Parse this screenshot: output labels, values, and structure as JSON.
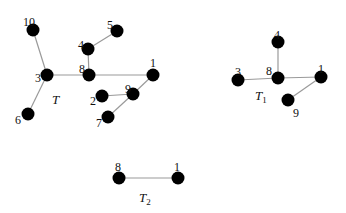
{
  "figure": {
    "graphs": [
      {
        "id": "T",
        "label": "T",
        "subscript": "",
        "label_pos": [
          52,
          104
        ],
        "nodes": [
          {
            "id": "10",
            "x": 33,
            "y": 30,
            "lx": 23,
            "ly": 22
          },
          {
            "id": "5",
            "x": 117,
            "y": 31,
            "lx": 107,
            "ly": 25
          },
          {
            "id": "4",
            "x": 88,
            "y": 49,
            "lx": 78,
            "ly": 45
          },
          {
            "id": "3",
            "x": 47,
            "y": 75,
            "lx": 35,
            "ly": 78
          },
          {
            "id": "8",
            "x": 89,
            "y": 75,
            "lx": 79,
            "ly": 69
          },
          {
            "id": "1",
            "x": 153,
            "y": 75,
            "lx": 150,
            "ly": 63
          },
          {
            "id": "2",
            "x": 102,
            "y": 96,
            "lx": 90,
            "ly": 101
          },
          {
            "id": "9",
            "x": 133,
            "y": 94,
            "lx": 125,
            "ly": 89
          },
          {
            "id": "6",
            "x": 28,
            "y": 114,
            "lx": 15,
            "ly": 120
          },
          {
            "id": "7",
            "x": 108,
            "y": 117,
            "lx": 96,
            "ly": 123
          }
        ],
        "edges": [
          [
            "10",
            "3"
          ],
          [
            "3",
            "8"
          ],
          [
            "8",
            "1"
          ],
          [
            "3",
            "6"
          ],
          [
            "8",
            "4"
          ],
          [
            "4",
            "5"
          ],
          [
            "1",
            "9"
          ],
          [
            "9",
            "2"
          ],
          [
            "9",
            "7"
          ]
        ]
      },
      {
        "id": "T1",
        "label": "T",
        "subscript": "1",
        "label_pos": [
          255,
          100
        ],
        "nodes": [
          {
            "id": "4",
            "x": 278,
            "y": 42,
            "lx": 274,
            "ly": 35
          },
          {
            "id": "3",
            "x": 238,
            "y": 80,
            "lx": 235,
            "ly": 72
          },
          {
            "id": "8",
            "x": 278,
            "y": 78,
            "lx": 266,
            "ly": 71
          },
          {
            "id": "1",
            "x": 321,
            "y": 77,
            "lx": 318,
            "ly": 69
          },
          {
            "id": "9",
            "x": 288,
            "y": 100,
            "lx": 293,
            "ly": 113
          }
        ],
        "edges": [
          [
            "3",
            "8"
          ],
          [
            "8",
            "4"
          ],
          [
            "8",
            "1"
          ],
          [
            "1",
            "9"
          ]
        ]
      },
      {
        "id": "T2",
        "label": "T",
        "subscript": "2",
        "label_pos": [
          139,
          202
        ],
        "nodes": [
          {
            "id": "8",
            "x": 119,
            "y": 178,
            "lx": 115,
            "ly": 167
          },
          {
            "id": "1",
            "x": 178,
            "y": 178,
            "lx": 174,
            "ly": 167
          }
        ],
        "edges": [
          [
            "8",
            "1"
          ]
        ]
      }
    ],
    "colors": {
      "node": "#000000",
      "edge": "#9a9a9a",
      "text": "#111111"
    }
  }
}
